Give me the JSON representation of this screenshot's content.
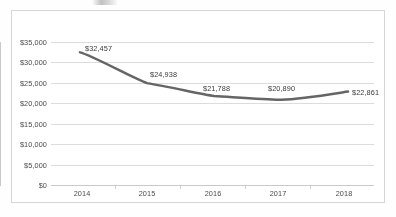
{
  "chart_data": {
    "type": "line",
    "title": "",
    "subtitle": "",
    "xlabel": "",
    "ylabel": "",
    "categories": [
      "2014",
      "2015",
      "2016",
      "2017",
      "2018"
    ],
    "values": [
      32457,
      24938,
      21788,
      20890,
      22861
    ],
    "data_labels": [
      "$32,457",
      "$24,938",
      "$21,788",
      "$20,890",
      "$22,861"
    ],
    "series": [
      {
        "name": "",
        "values": [
          32457,
          24938,
          21788,
          20890,
          22861
        ],
        "color": "#595959",
        "line_width": 2.5,
        "smooth": true,
        "markers": false
      }
    ],
    "ylim": [
      0,
      35000
    ],
    "ytick_values": [
      0,
      5000,
      10000,
      15000,
      20000,
      25000,
      30000,
      35000
    ],
    "ytick_labels": [
      "$0",
      "$5,000",
      "$10,000",
      "$15,000",
      "$20,000",
      "$25,000",
      "$30,000",
      "$35,000"
    ],
    "xtick_labels": [
      "2014",
      "2015",
      "2016",
      "2017",
      "2018"
    ],
    "grid": {
      "horizontal": true,
      "vertical": false,
      "color": "#dcdcdc"
    },
    "legend": {
      "visible": false,
      "position": "none",
      "entries": []
    },
    "axis_color": "#c9c9c9",
    "tick_text_color": "#4a4a4a",
    "data_label_color": "#3a3a3a",
    "plot_background": "#ffffff",
    "frame_border_color": "#d6d6d6"
  }
}
